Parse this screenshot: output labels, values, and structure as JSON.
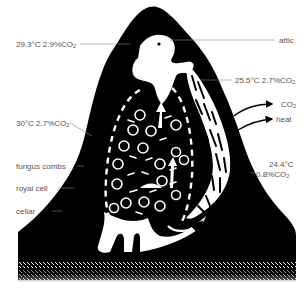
{
  "diagram": {
    "labels": {
      "top_left": {
        "text": "29.3°C 2.9%CO",
        "sub": "2"
      },
      "attic": {
        "text": "attic"
      },
      "right_upper": {
        "text": "25.5°C 2.7%CO",
        "sub": "2"
      },
      "co2_arrow": {
        "text": "CO",
        "sub": "2"
      },
      "heat_arrow": {
        "text": "heat"
      },
      "left_middle": {
        "text": "30°C 2.7%CO",
        "sub": "2"
      },
      "fungus_combs": {
        "text": "fungus combs"
      },
      "royal_cell": {
        "text": "royal cell"
      },
      "cellar": {
        "text": "cellar"
      },
      "right_lower_temp": {
        "text": "24.4°C"
      },
      "right_lower_co2": {
        "text": "0.8%CO",
        "sub": "2"
      }
    },
    "colors": {
      "mound": "#000000",
      "chambers": "#ffffff",
      "text": "#555555",
      "leader_lines": "#888888"
    }
  }
}
